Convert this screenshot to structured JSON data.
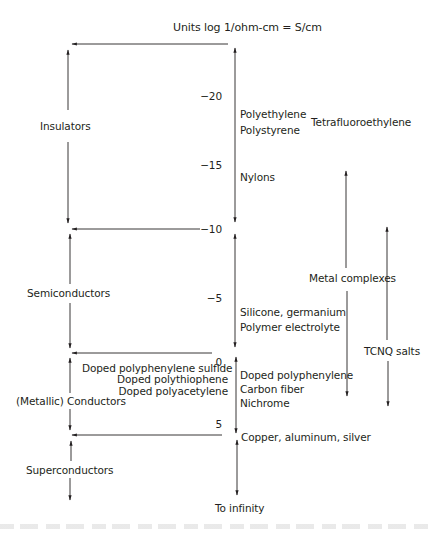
{
  "diagram": {
    "title": "Units log 1/ohm-cm = S/cm",
    "scale": {
      "ticks": [
        "−20",
        "−15",
        "−10",
        "−5",
        "0",
        "5"
      ],
      "end_label": "To infinity"
    },
    "categories": [
      {
        "label": "Insulators"
      },
      {
        "label": "Semiconductors"
      },
      {
        "label": "(Metallic) Conductors"
      },
      {
        "label": "Superconductors"
      }
    ],
    "left_materials": [
      "Doped polyphenylene sulfide",
      "Doped  polythiophene",
      "Doped polyacetylene"
    ],
    "right_materials": {
      "insulators": [
        "Polyethylene",
        "Polystyrene",
        "Nylons"
      ],
      "semiconductors": [
        "Silicone, germanium",
        "Polymer electrolyte"
      ],
      "conductors": [
        "Doped polyphenylene",
        "Carbon fiber",
        "Nichrome"
      ],
      "superconductors": [
        "Copper, aluminum, silver"
      ]
    },
    "far_right": {
      "tetrafluoroethylene": "Tetrafluoroethylene",
      "metal_complexes": "Metal complexes",
      "tcnq_salts": "TCNQ salts"
    }
  }
}
